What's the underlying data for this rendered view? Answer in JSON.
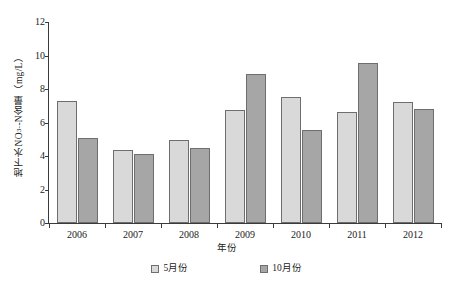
{
  "chart_data": {
    "type": "bar",
    "title": "",
    "xlabel": "年份",
    "ylabel": "地下水NO3--N含量（mg/L）",
    "categories": [
      "2006",
      "2007",
      "2008",
      "2009",
      "2010",
      "2011",
      "2012"
    ],
    "series": [
      {
        "name": "5月份",
        "color": "#d9d9d9",
        "values": [
          7.3,
          4.35,
          4.95,
          6.75,
          7.5,
          6.6,
          7.25
        ]
      },
      {
        "name": "10月份",
        "color": "#a6a6a6",
        "values": [
          5.1,
          4.15,
          4.5,
          8.9,
          5.55,
          9.55,
          6.8
        ]
      }
    ],
    "ylim": [
      0,
      12
    ],
    "ytick_values": [
      0,
      2,
      4,
      6,
      8,
      10,
      12
    ],
    "ytick_labels": [
      "0",
      "2",
      "4",
      "6",
      "8",
      "10",
      "12"
    ],
    "grid": false,
    "legend_position": "bottom"
  },
  "axis": {
    "y_title_main": "地下水NO",
    "y_title_sub": "3",
    "y_title_sup": "-",
    "y_title_tail": "-N含量（mg/L）",
    "x_title": "年份"
  },
  "legend": {
    "items": [
      {
        "label": "5月份"
      },
      {
        "label": "10月份"
      }
    ]
  }
}
